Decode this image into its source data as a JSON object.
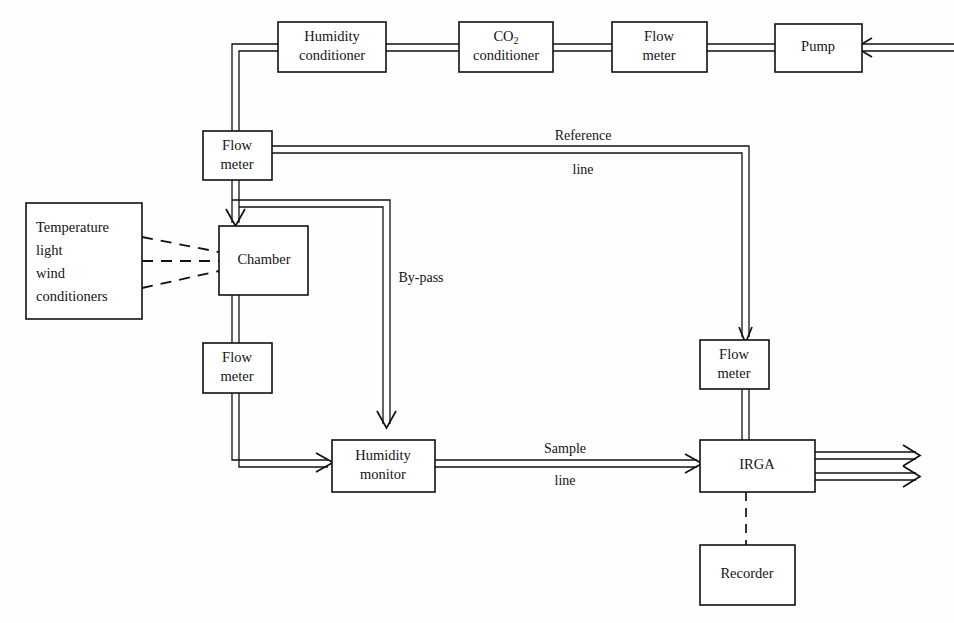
{
  "figure": {
    "kind": "gas-exchange-system-schematic",
    "background_color": "#fefefe",
    "line_color": "#111111",
    "box_fill": "#ffffff"
  },
  "boxes": {
    "humidity_conditioner": {
      "line1": "Humidity",
      "line2": "conditioner"
    },
    "co2_conditioner": {
      "line1": "CO",
      "sub": "2",
      "line2": "conditioner"
    },
    "flow_meter_top": {
      "line1": "Flow",
      "line2": "meter"
    },
    "pump": {
      "line1": "Pump"
    },
    "flow_meter_left_upper": {
      "line1": "Flow",
      "line2": "meter"
    },
    "conditioners": {
      "line1": "Temperature",
      "line2": "light",
      "line3": "wind",
      "line4": "conditioners"
    },
    "chamber": {
      "line1": "Chamber"
    },
    "flow_meter_left_lower": {
      "line1": "Flow",
      "line2": "meter"
    },
    "humidity_monitor": {
      "line1": "Humidity",
      "line2": "monitor"
    },
    "flow_meter_right": {
      "line1": "Flow",
      "line2": "meter"
    },
    "irga": {
      "line1": "IRGA"
    },
    "recorder": {
      "line1": "Recorder"
    }
  },
  "pipe_labels": {
    "reference_top": "Reference",
    "reference_bottom": "line",
    "bypass": "By-pass",
    "sample_top": "Sample",
    "sample_bottom": "line"
  }
}
